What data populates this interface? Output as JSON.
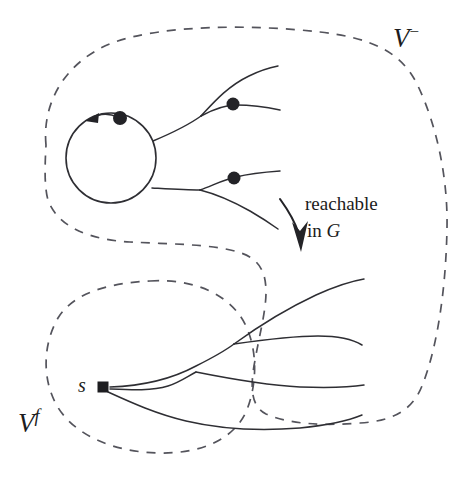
{
  "figure": {
    "type": "graph-theory-diagram",
    "background_color": "#ffffff",
    "stroke_color": "#2e2e33",
    "dashed_stroke_color": "#54545c",
    "node_fill_color": "#232327"
  },
  "labels": {
    "region_upper": {
      "base": "V",
      "superscript": "−",
      "full": "V−"
    },
    "region_lower": {
      "base": "V",
      "superscript": "f",
      "full": "Vf"
    },
    "source_node": "s",
    "annotation_line_1": "reachable",
    "annotation_line_2_prefix": "in ",
    "annotation_line_2_graph": "G"
  },
  "nodes": [
    {
      "name": "cycle-vertex",
      "shape": "dot",
      "x": 120,
      "y": 118,
      "r": 7
    },
    {
      "name": "upper-branch-vertex",
      "shape": "dot",
      "x": 233,
      "y": 104,
      "r": 6.5
    },
    {
      "name": "lower-branch-vertex",
      "shape": "dot",
      "x": 234,
      "y": 178,
      "r": 6.5
    },
    {
      "name": "source-node-s",
      "shape": "square",
      "x": 103,
      "y": 387,
      "size": 11
    }
  ],
  "regions": [
    {
      "name": "v-minus-region",
      "style": "dashed",
      "label": "V−"
    },
    {
      "name": "v-f-region",
      "style": "dashed",
      "label": "Vf"
    }
  ],
  "edges": {
    "cycle": {
      "name": "directed-cycle",
      "cx": 111,
      "cy": 158,
      "r": 45,
      "direction": "counterclockwise"
    },
    "upper_tree_count": 3,
    "lower_tree_count": 4
  }
}
